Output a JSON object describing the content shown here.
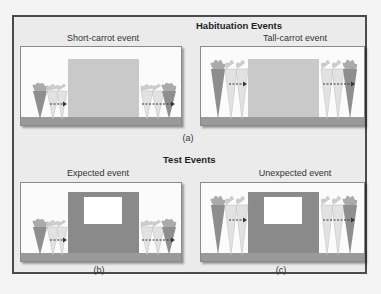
{
  "figure": {
    "sections": [
      {
        "title": "Habituation Events",
        "panels": [
          {
            "caption": "Short-carrot event",
            "screen_color": "#c9c9c9",
            "carrot_size": "short",
            "has_window": false
          },
          {
            "caption": "Tall-carrot event",
            "screen_color": "#c9c9c9",
            "carrot_size": "tall",
            "has_window": false
          }
        ],
        "panel_letter": "(a)"
      },
      {
        "title": "Test Events",
        "panels": [
          {
            "caption": "Expected event",
            "screen_color": "#8a8a8a",
            "carrot_size": "short",
            "has_window": true,
            "letter": "(b)"
          },
          {
            "caption": "Unexpected event",
            "screen_color": "#8a8a8a",
            "carrot_size": "tall",
            "has_window": true,
            "letter": "(c)"
          }
        ]
      }
    ],
    "colors": {
      "frame_border": "#4a4a4a",
      "frame_bg": "#ebebeb",
      "panel_bg": "#fbfbfb",
      "ground": "#9a9a9a",
      "carrot_dark": "#8e8e8e",
      "carrot_light": "#e2e2e2",
      "arrow": "#333333"
    }
  }
}
